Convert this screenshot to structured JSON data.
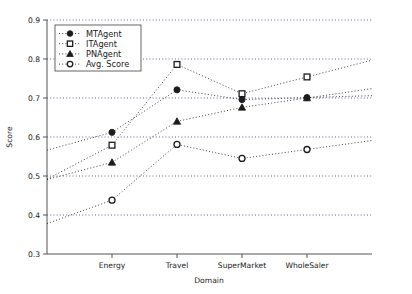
{
  "chart_data": {
    "type": "line",
    "title": "",
    "xlabel": "Domain",
    "ylabel": "Score",
    "categories": [
      "Energy",
      "Travel",
      "SuperMarket",
      "WholeSaler"
    ],
    "ylim": [
      0.3,
      0.9
    ],
    "yticks": [
      "0.3",
      "0.4",
      "0.5",
      "0.6",
      "0.7",
      "0.8",
      "0.9"
    ],
    "ytick_values": [
      0.3,
      0.4,
      0.5,
      0.6,
      0.7,
      0.8,
      0.9
    ],
    "grid": true,
    "grid_axis": "y",
    "legend_position": "upper left",
    "series": [
      {
        "name": "MTAgent",
        "marker": "filled-circle",
        "values": [
          0.612,
          0.721,
          0.696,
          0.701
        ]
      },
      {
        "name": "ITAgent",
        "marker": "open-square",
        "values": [
          0.579,
          0.786,
          0.711,
          0.754
        ]
      },
      {
        "name": "PNAgent",
        "marker": "filled-triangle",
        "values": [
          0.535,
          0.64,
          0.676,
          0.7
        ]
      },
      {
        "name": "Avg. Score",
        "marker": "open-circle",
        "values": [
          0.438,
          0.581,
          0.545,
          0.568
        ]
      }
    ]
  },
  "legend": {
    "entries": [
      {
        "label": "MTAgent"
      },
      {
        "label": "ITAgent"
      },
      {
        "label": "PNAgent"
      },
      {
        "label": "Avg. Score"
      }
    ]
  },
  "axes": {
    "x_title": "Domain",
    "y_title": "Score",
    "x_labels": [
      "Energy",
      "Travel",
      "SuperMarket",
      "WholeSaler"
    ],
    "y_labels": [
      "0.9",
      "0.8",
      "0.7",
      "0.6",
      "0.5",
      "0.4",
      "0.3"
    ]
  }
}
